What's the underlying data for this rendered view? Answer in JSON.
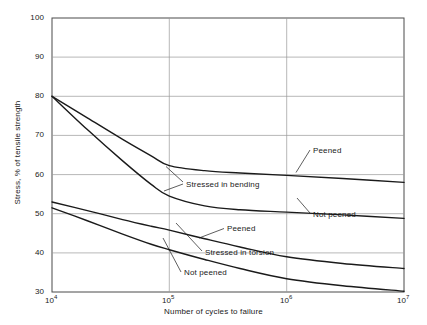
{
  "chart_data": {
    "type": "line",
    "title": "",
    "xlabel": "Number of cycles to failure",
    "ylabel": "Stress, % of tensile strength",
    "xscale": "log",
    "xlim": [
      10000,
      10000000
    ],
    "ylim": [
      30,
      100
    ],
    "grid": true,
    "legend_position": "inline-annotations",
    "xticks": [
      {
        "value": 10000,
        "label": "10",
        "exponent": "4"
      },
      {
        "value": 100000,
        "label": "10",
        "exponent": "5"
      },
      {
        "value": 1000000,
        "label": "10",
        "exponent": "6"
      },
      {
        "value": 10000000,
        "label": "10",
        "exponent": "7"
      }
    ],
    "yticks": [
      30,
      40,
      50,
      60,
      70,
      80,
      90,
      100
    ],
    "series": [
      {
        "name": "Stressed in bending, peened",
        "group": "Stressed in bending",
        "condition": "Peened",
        "x": [
          10000,
          20000,
          40000,
          70000,
          100000,
          200000,
          400000,
          1000000,
          3000000,
          10000000
        ],
        "y": [
          80.0,
          74.5,
          69.0,
          64.8,
          62.3,
          61.0,
          60.4,
          59.8,
          59.0,
          58.0
        ]
      },
      {
        "name": "Stressed in bending, not peened",
        "group": "Stressed in bending",
        "condition": "Not peened",
        "x": [
          10000,
          20000,
          40000,
          70000,
          100000,
          200000,
          400000,
          1000000,
          3000000,
          10000000
        ],
        "y": [
          80.0,
          71.5,
          63.5,
          57.5,
          54.5,
          52.0,
          51.0,
          50.4,
          49.7,
          48.8
        ]
      },
      {
        "name": "Stressed in torsion, peened",
        "group": "Stressed in torsion",
        "condition": "Peened",
        "x": [
          10000,
          20000,
          40000,
          70000,
          100000,
          200000,
          400000,
          1000000,
          3000000,
          10000000
        ],
        "y": [
          53.0,
          50.8,
          48.5,
          46.8,
          45.8,
          43.6,
          41.5,
          39.0,
          37.3,
          36.0
        ]
      },
      {
        "name": "Stressed in torsion, not peened",
        "group": "Stressed in torsion",
        "condition": "Not peened",
        "x": [
          10000,
          20000,
          40000,
          70000,
          100000,
          200000,
          400000,
          1000000,
          3000000,
          10000000
        ],
        "y": [
          51.5,
          48.2,
          44.8,
          42.2,
          40.8,
          38.3,
          36.0,
          33.4,
          31.6,
          30.2
        ]
      }
    ],
    "annotations": [
      {
        "id": "ann-bending-peened",
        "text": "Peened",
        "x": 311,
        "y": 152
      },
      {
        "id": "ann-bending-label",
        "text": "Stressed in bending",
        "x": 184,
        "y": 186
      },
      {
        "id": "ann-bending-not-peened",
        "text": "Not peened",
        "x": 311,
        "y": 216
      },
      {
        "id": "ann-torsion-peened",
        "text": "Peened",
        "x": 225,
        "y": 231
      },
      {
        "id": "ann-torsion-label",
        "text": "Stressed in torsion",
        "x": 203,
        "y": 255
      },
      {
        "id": "ann-torsion-not-peened",
        "text": "Not peened",
        "x": 182,
        "y": 275
      }
    ],
    "colors": {
      "curve": "#1a1a1a",
      "grid": "#9a9a9a",
      "axis": "#4a4a4a",
      "background": "#ffffff",
      "text": "#1a1a1a"
    }
  }
}
